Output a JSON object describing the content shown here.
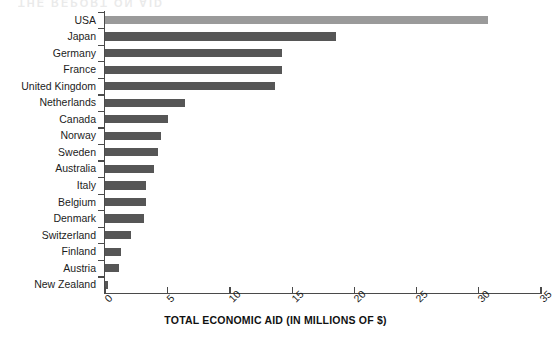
{
  "chart_data": {
    "type": "bar",
    "orientation": "horizontal",
    "title": "",
    "xlabel": "TOTAL ECONOMIC AID (IN MILLIONS OF $)",
    "ylabel": "",
    "xlim": [
      0,
      35
    ],
    "xticks": [
      0,
      5,
      10,
      15,
      20,
      25,
      30,
      35
    ],
    "grid": false,
    "legend": false,
    "categories": [
      "USA",
      "Japan",
      "Germany",
      "France",
      "United Kingdom",
      "Netherlands",
      "Canada",
      "Norway",
      "Sweden",
      "Australia",
      "Italy",
      "Belgium",
      "Denmark",
      "Switzerland",
      "Finland",
      "Austria",
      "New Zealand"
    ],
    "values": [
      30.8,
      18.6,
      14.2,
      14.2,
      13.7,
      6.4,
      5.1,
      4.5,
      4.3,
      3.9,
      3.3,
      3.3,
      3.1,
      2.1,
      1.3,
      1.1,
      0.25
    ],
    "bar_color": "#565656",
    "highlight_color": "#9a9a9a",
    "highlight_category": "USA",
    "axis_color": "#4a4a4a"
  },
  "bleed_text": "THE REPORT ON AID"
}
